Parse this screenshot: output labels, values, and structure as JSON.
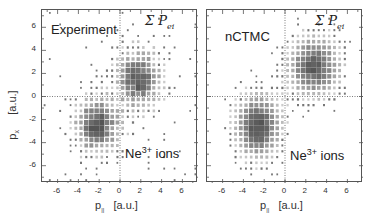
{
  "figure": {
    "y_axis_title": "p",
    "y_axis_sub": "x",
    "y_axis_unit": "[a.u.]",
    "x_axis_title": "p",
    "x_axis_sub": "||",
    "x_axis_unit": "[a.u.]",
    "panels": [
      {
        "title": "Experiment",
        "sum_label": "Σ P",
        "sum_sub": "ei",
        "ion_label": "Ne",
        "ion_charge": "3+",
        "ion_suffix": " ions"
      },
      {
        "title": "nCTMC",
        "sum_label": "Σ P",
        "sum_sub": "ei",
        "ion_label": "Ne",
        "ion_charge": "3+",
        "ion_suffix": " ions"
      }
    ],
    "x_ticks": [
      "-6",
      "-4",
      "-2",
      "0",
      "2",
      "4",
      "6"
    ],
    "y_ticks": [
      "6",
      "4",
      "2",
      "0",
      "-2",
      "-4",
      "-6"
    ]
  },
  "chart_data": [
    {
      "type": "heatmap",
      "title": "Experiment",
      "xlabel": "p|| [a.u.]",
      "ylabel": "px [a.u.]",
      "xlim": [
        -7.5,
        7.5
      ],
      "ylim": [
        -7.5,
        7.5
      ],
      "x_ticks": [
        -6,
        -4,
        -2,
        0,
        2,
        4,
        6
      ],
      "y_ticks": [
        -6,
        -4,
        -2,
        0,
        2,
        4,
        6
      ],
      "reference_lines": {
        "x": 0,
        "y": 0,
        "style": "dotted"
      },
      "annotations": [
        "Experiment",
        "Σ P_ei",
        "Ne3+ ions"
      ],
      "bin_size": 0.5,
      "clusters": [
        {
          "center": [
            -2.2,
            -2.5
          ],
          "sigma": [
            1.4,
            1.6
          ],
          "peak": 1.0
        },
        {
          "center": [
            1.8,
            1.5
          ],
          "sigma": [
            1.4,
            1.7
          ],
          "peak": 0.95
        }
      ],
      "noise": 0.12,
      "seed": 7
    },
    {
      "type": "heatmap",
      "title": "nCTMC",
      "xlabel": "p|| [a.u.]",
      "ylabel": "px [a.u.]",
      "xlim": [
        -7.5,
        7.5
      ],
      "ylim": [
        -7.5,
        7.5
      ],
      "x_ticks": [
        -6,
        -4,
        -2,
        0,
        2,
        4,
        6
      ],
      "y_ticks": [
        -6,
        -4,
        -2,
        0,
        2,
        4,
        6
      ],
      "reference_lines": {
        "x": 0,
        "y": 0,
        "style": "dotted"
      },
      "annotations": [
        "nCTMC",
        "Σ P_ei",
        "Ne3+ ions"
      ],
      "bin_size": 0.5,
      "clusters": [
        {
          "center": [
            -2.6,
            -2.6
          ],
          "sigma": [
            1.5,
            1.9
          ],
          "peak": 1.0
        },
        {
          "center": [
            2.8,
            2.6
          ],
          "sigma": [
            1.7,
            1.8
          ],
          "peak": 0.95
        }
      ],
      "noise": 0.06,
      "seed": 13
    }
  ]
}
